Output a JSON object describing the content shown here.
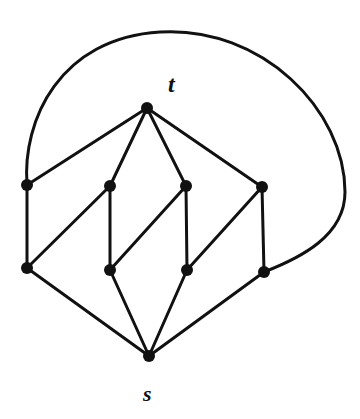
{
  "figure": {
    "title": "",
    "background_color": "#ffffff",
    "ink_color": "#111111",
    "width": 360,
    "height": 419
  },
  "labels": {
    "source": "s",
    "sink": "t"
  },
  "chart_data": {
    "type": "diagram",
    "diagram_kind": "undirected-graph",
    "title": "",
    "xlabel": "",
    "ylabel": "",
    "node_radius": 6,
    "edge_width": 3,
    "nodes": [
      {
        "id": "t",
        "label": "t",
        "x": 147,
        "y": 108,
        "label_dx": 21,
        "label_dy": -22
      },
      {
        "id": "a1",
        "label": "",
        "x": 27,
        "y": 185
      },
      {
        "id": "a2",
        "label": "",
        "x": 110,
        "y": 186
      },
      {
        "id": "a3",
        "label": "",
        "x": 186,
        "y": 186
      },
      {
        "id": "a4",
        "label": "",
        "x": 262,
        "y": 187
      },
      {
        "id": "b1",
        "label": "",
        "x": 27,
        "y": 268
      },
      {
        "id": "b2",
        "label": "",
        "x": 110,
        "y": 270
      },
      {
        "id": "b3",
        "label": "",
        "x": 187,
        "y": 270
      },
      {
        "id": "b4",
        "label": "",
        "x": 264,
        "y": 272
      },
      {
        "id": "s",
        "label": "s",
        "x": 149,
        "y": 356,
        "label_dx": 2,
        "label_dy": 39
      }
    ],
    "edges": [
      {
        "from": "t",
        "to": "a1",
        "kind": "line"
      },
      {
        "from": "t",
        "to": "a2",
        "kind": "line"
      },
      {
        "from": "t",
        "to": "a3",
        "kind": "line"
      },
      {
        "from": "t",
        "to": "a4",
        "kind": "line"
      },
      {
        "from": "a1",
        "to": "b1",
        "kind": "line"
      },
      {
        "from": "a2",
        "to": "b2",
        "kind": "line"
      },
      {
        "from": "a3",
        "to": "b3",
        "kind": "line"
      },
      {
        "from": "a4",
        "to": "b4",
        "kind": "line"
      },
      {
        "from": "a2",
        "to": "b1",
        "kind": "line"
      },
      {
        "from": "a3",
        "to": "b2",
        "kind": "line"
      },
      {
        "from": "a4",
        "to": "b3",
        "kind": "line"
      },
      {
        "from": "b1",
        "to": "s",
        "kind": "line"
      },
      {
        "from": "b2",
        "to": "s",
        "kind": "line"
      },
      {
        "from": "b3",
        "to": "s",
        "kind": "line"
      },
      {
        "from": "b4",
        "to": "s",
        "kind": "line"
      },
      {
        "from": "a1",
        "to": "b4",
        "kind": "arc",
        "path": "M 27 185 C 22 120 60 38 160 32 C 262 26 345 110 345 192 C 345 236 300 258 264 272"
      }
    ],
    "node_count": 10,
    "edge_count": 16,
    "legend": [],
    "annotations": []
  }
}
